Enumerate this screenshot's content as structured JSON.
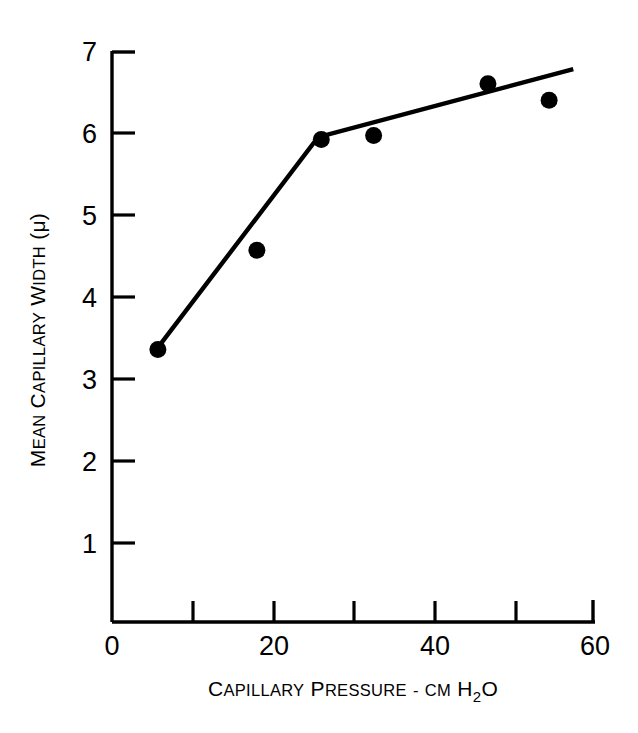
{
  "figure": {
    "background_color": "#ffffff",
    "ink_color": "#000000",
    "width": 638,
    "height": 733
  },
  "chart_data": {
    "type": "scatter",
    "title": "",
    "subtitle": "",
    "xlabel_parts": {
      "word1_cap": "C",
      "word1_rest": "APILLARY",
      "word2_cap": "P",
      "word2_rest": "RESSURE",
      "separator": "-",
      "unit_prefix": "CM",
      "unit_element": "H",
      "unit_subscript": "2",
      "unit_element2": "O"
    },
    "xlabel": "CAPILLARY PRESSURE - CM H2O",
    "ylabel_parts": {
      "word1_cap": "M",
      "word1_rest": "EAN",
      "word2_cap": "C",
      "word2_rest": "APILLARY",
      "word3_cap": "W",
      "word3_rest": "IDTH",
      "unit": "(μ)"
    },
    "ylabel": "MEAN CAPILLARY WIDTH (μ)",
    "xlim": [
      0,
      60
    ],
    "ylim": [
      0,
      7
    ],
    "grid": false,
    "legend": "none",
    "x_major_ticks": [
      0,
      20,
      40,
      60
    ],
    "x_major_tick_labels": [
      "0",
      "20",
      "40",
      "60"
    ],
    "x_minor_ticks": [
      10,
      30,
      50
    ],
    "y_major_ticks": [
      1,
      2,
      3,
      4,
      5,
      6,
      7
    ],
    "y_major_tick_labels": [
      "1",
      "2",
      "3",
      "4",
      "5",
      "6",
      "7"
    ],
    "y_minor_ticks": [],
    "x": [
      5.7,
      18.0,
      26.0,
      32.5,
      46.7,
      54.3
    ],
    "y": [
      3.36,
      4.57,
      5.92,
      5.97,
      6.6,
      6.4
    ],
    "points": [
      {
        "x": 5.7,
        "y": 3.36
      },
      {
        "x": 18.0,
        "y": 4.57
      },
      {
        "x": 26.0,
        "y": 5.92
      },
      {
        "x": 32.5,
        "y": 5.97
      },
      {
        "x": 46.7,
        "y": 6.6
      },
      {
        "x": 54.3,
        "y": 6.4
      }
    ],
    "marker": "filled-circle",
    "marker_size_px": 17,
    "series": [
      {
        "name": "Mean capillary width measurements",
        "type": "scatter",
        "values": [
          3.36,
          4.57,
          5.92,
          5.97,
          6.6,
          6.4
        ]
      },
      {
        "name": "Fitted broken-line trend",
        "type": "line",
        "vertices": [
          {
            "x": 5.6,
            "y": 3.37
          },
          {
            "x": 25.6,
            "y": 5.95
          },
          {
            "x": 57.3,
            "y": 6.78
          }
        ]
      }
    ],
    "fit_line": {
      "style": "two-segment piecewise linear",
      "breakpoint_x": 25.6,
      "breakpoint_y": 5.95,
      "start": {
        "x": 5.6,
        "y": 3.37
      },
      "end": {
        "x": 57.3,
        "y": 6.78
      }
    },
    "annotations": []
  }
}
